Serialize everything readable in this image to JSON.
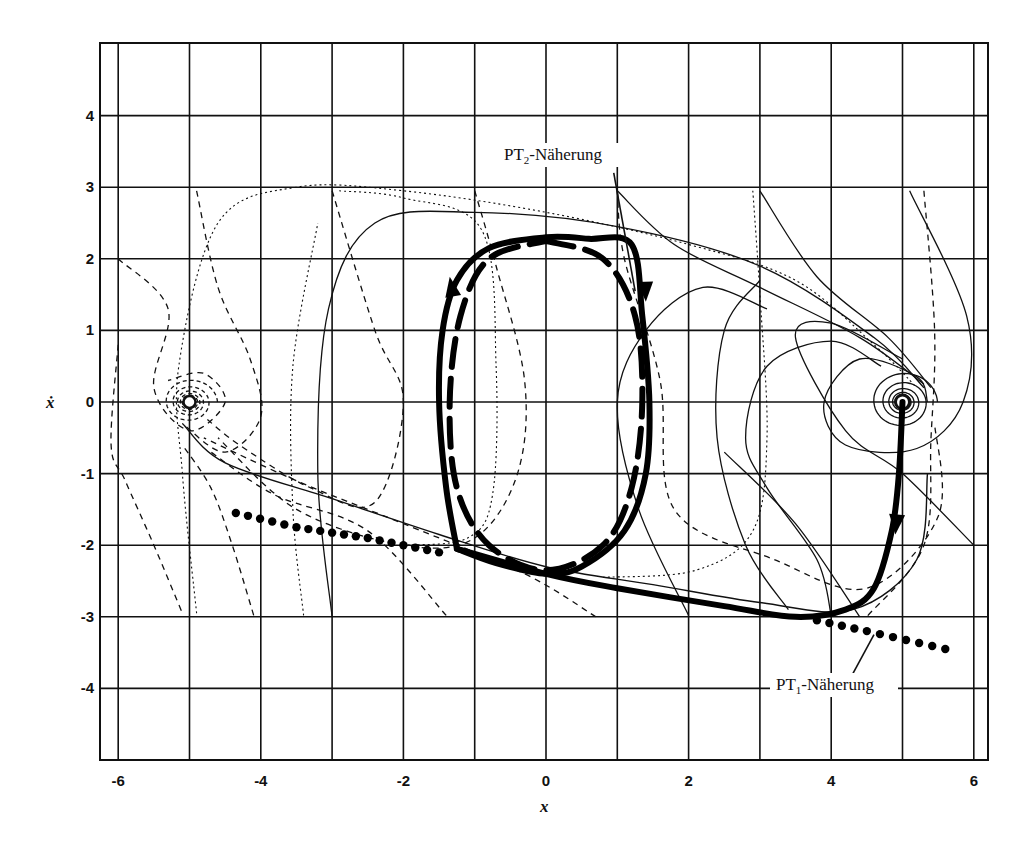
{
  "chart_data": {
    "type": "line",
    "title": "",
    "xlabel": "x",
    "ylabel": "ẋ",
    "xlim": [
      -6.25,
      6.2
    ],
    "ylim": [
      -5.0,
      5.0
    ],
    "grid": true,
    "x_ticks": [
      -6,
      -4,
      -2,
      0,
      2,
      4,
      6
    ],
    "x_tick_labels": [
      "-6",
      "-4",
      "-2",
      "0",
      "2",
      "4",
      "6"
    ],
    "y_ticks": [
      4,
      3,
      2,
      1,
      0,
      -1,
      -2,
      -3,
      -4
    ],
    "y_tick_labels": [
      "4",
      "3",
      "2",
      "1",
      "0",
      "-1",
      "-2",
      "-3",
      "-4"
    ],
    "x_grid_step": 1,
    "y_grid_step": 1,
    "equilibria": [
      {
        "name": "left-focus",
        "x": -5.0,
        "y": 0.0
      },
      {
        "name": "right-focus",
        "x": 5.0,
        "y": 0.0
      }
    ],
    "annotations": [
      {
        "text": "PT2-Näherung",
        "main": "PT",
        "sub": "2",
        "rest": "-Näherung",
        "x": 0.6,
        "y": 3.5,
        "points_to": [
          1.3,
          1.6
        ]
      },
      {
        "text": "PT1-Näherung",
        "main": "PT",
        "sub": "1",
        "rest": "-Näherung",
        "x": 5.4,
        "y": -3.6,
        "points_to": [
          4.5,
          -3.2
        ]
      }
    ],
    "series": [
      {
        "name": "limit-cycle-trajectory",
        "style": "thick-solid",
        "description": "Closed switching trajectory with arrows",
        "points": [
          [
            -1.25,
            -2.05
          ],
          [
            -1.4,
            -1.2
          ],
          [
            -1.5,
            0
          ],
          [
            -1.45,
            1.0
          ],
          [
            -1.25,
            1.7
          ],
          [
            -0.8,
            2.15
          ],
          [
            0,
            2.3
          ],
          [
            0.6,
            2.28
          ],
          [
            1.2,
            2.2
          ],
          [
            1.35,
            1.2
          ],
          [
            1.45,
            0
          ],
          [
            1.4,
            -1.0
          ],
          [
            1.1,
            -1.8
          ],
          [
            0.5,
            -2.3
          ],
          [
            0,
            -2.4
          ],
          [
            -0.7,
            -2.25
          ],
          [
            -1.25,
            -2.05
          ]
        ]
      },
      {
        "name": "PT2-approximation",
        "style": "thick-dashed",
        "points": [
          [
            0,
            2.25
          ],
          [
            0.8,
            2.0
          ],
          [
            1.25,
            1.2
          ],
          [
            1.35,
            0
          ],
          [
            1.2,
            -1.2
          ],
          [
            0.8,
            -2.0
          ],
          [
            0,
            -2.35
          ],
          [
            -0.8,
            -2.0
          ],
          [
            -1.25,
            -1.2
          ],
          [
            -1.35,
            0
          ],
          [
            -1.2,
            1.2
          ],
          [
            -0.8,
            2.0
          ],
          [
            0,
            2.25
          ]
        ]
      },
      {
        "name": "approach-trajectory",
        "style": "thick-solid",
        "description": "From right focus down and back along lower branch",
        "points": [
          [
            5.0,
            0.0
          ],
          [
            4.95,
            -1.0
          ],
          [
            4.85,
            -1.8
          ],
          [
            4.6,
            -2.6
          ],
          [
            4.2,
            -2.9
          ],
          [
            3.5,
            -3.0
          ],
          [
            2.5,
            -2.85
          ],
          [
            1.0,
            -2.6
          ],
          [
            0,
            -2.4
          ],
          [
            -1.25,
            -2.05
          ]
        ]
      },
      {
        "name": "PT1-approximation-upper",
        "style": "dotted-large",
        "points": [
          [
            -4.35,
            -1.55
          ],
          [
            -3.5,
            -1.75
          ],
          [
            -2.5,
            -1.9
          ],
          [
            -1.5,
            -2.1
          ]
        ]
      },
      {
        "name": "PT1-approximation-lower",
        "style": "dotted-large",
        "points": [
          [
            3.8,
            -3.05
          ],
          [
            4.5,
            -3.2
          ],
          [
            5.6,
            -3.45
          ]
        ]
      }
    ]
  },
  "labels": {
    "x_axis": "x",
    "y_axis": "ẋ",
    "pt2": {
      "main": "PT",
      "sub": "2",
      "rest": "-Näherung"
    },
    "pt1": {
      "main": "PT",
      "sub": "1",
      "rest": "-Näherung"
    }
  },
  "ticks": {
    "x": [
      "-6",
      "-4",
      "-2",
      "0",
      "2",
      "4",
      "6"
    ],
    "y": [
      "4",
      "3",
      "2",
      "1",
      "0",
      "-1",
      "-2",
      "-3",
      "-4"
    ]
  }
}
